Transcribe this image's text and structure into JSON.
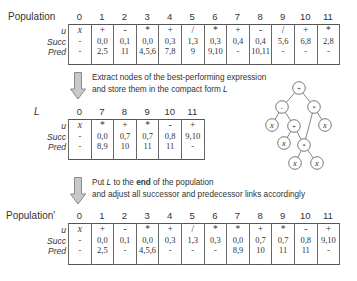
{
  "row_labels": [
    "u",
    "Succ",
    "Pred"
  ],
  "population": {
    "title": "Population",
    "columns": [
      {
        "idx": "0",
        "u": "x",
        "succ": "-",
        "pred": "-"
      },
      {
        "idx": "1",
        "u": "+",
        "succ": "0,0",
        "pred": "2,5"
      },
      {
        "idx": "2",
        "u": "-",
        "succ": "0,1",
        "pred": "11"
      },
      {
        "idx": "3",
        "u": "*",
        "succ": "0,0",
        "pred": "4,5,6"
      },
      {
        "idx": "4",
        "u": "+",
        "succ": "0,3",
        "pred": "7,8"
      },
      {
        "idx": "5",
        "u": "/",
        "succ": "1,3",
        "pred": "9"
      },
      {
        "idx": "6",
        "u": "*",
        "succ": "0,3",
        "pred": "9,10"
      },
      {
        "idx": "7",
        "u": "+",
        "succ": "0,4",
        "pred": "-"
      },
      {
        "idx": "8",
        "u": "-",
        "succ": "0,4",
        "pred": "10,11"
      },
      {
        "idx": "9",
        "u": "/",
        "succ": "5,6",
        "pred": "-"
      },
      {
        "idx": "10",
        "u": "+",
        "succ": "6,8",
        "pred": "-"
      },
      {
        "idx": "11",
        "u": "*",
        "succ": "2,8",
        "pred": "-"
      }
    ]
  },
  "step1": {
    "line1": "Extract nodes of the best-performing expression",
    "line2_prefix": "and store them in the compact form ",
    "line2_var": "L"
  },
  "compact": {
    "title": "L",
    "columns": [
      {
        "idx": "0",
        "u": "x",
        "succ": "-",
        "pred": "-"
      },
      {
        "idx": "7",
        "u": "*",
        "succ": "0,0",
        "pred": "8,9"
      },
      {
        "idx": "8",
        "u": "+",
        "succ": "0,7",
        "pred": "10"
      },
      {
        "idx": "9",
        "u": "*",
        "succ": "0,7",
        "pred": "11"
      },
      {
        "idx": "10",
        "u": "-",
        "succ": "0,8",
        "pred": "11"
      },
      {
        "idx": "11",
        "u": "+",
        "succ": "9,10",
        "pred": "-"
      }
    ]
  },
  "tree": {
    "nodes": [
      {
        "id": "n0",
        "label": "+",
        "x": 299,
        "y": 88
      },
      {
        "id": "n1",
        "label": "-",
        "x": 282,
        "y": 107
      },
      {
        "id": "n2",
        "label": "*",
        "x": 314,
        "y": 107
      },
      {
        "id": "n3",
        "label": "x",
        "x": 272,
        "y": 125
      },
      {
        "id": "n4",
        "label": "+",
        "x": 294,
        "y": 126
      },
      {
        "id": "n5",
        "label": "x",
        "x": 325,
        "y": 125
      },
      {
        "id": "n6",
        "label": "x",
        "x": 284,
        "y": 143
      },
      {
        "id": "n7",
        "label": "*",
        "x": 304,
        "y": 145
      },
      {
        "id": "n8",
        "label": "x",
        "x": 295,
        "y": 163
      },
      {
        "id": "n9",
        "label": "x",
        "x": 317,
        "y": 163
      }
    ],
    "edges": [
      [
        "n0",
        "n1"
      ],
      [
        "n0",
        "n2"
      ],
      [
        "n1",
        "n3"
      ],
      [
        "n1",
        "n4"
      ],
      [
        "n2",
        "n5"
      ],
      [
        "n2",
        "n7"
      ],
      [
        "n4",
        "n6"
      ],
      [
        "n4",
        "n7"
      ],
      [
        "n7",
        "n8"
      ],
      [
        "n7",
        "n9"
      ]
    ]
  },
  "step2": {
    "line1_prefix": "Put ",
    "line1_var": "L",
    "line1_mid": " to the ",
    "line1_bold": "end",
    "line1_suffix": " of the population",
    "line2": "and adjust all successor and predecessor links accordingly"
  },
  "population_prime": {
    "title": "Population'",
    "columns": [
      {
        "idx": "0",
        "u": "x",
        "succ": "-",
        "pred": "-"
      },
      {
        "idx": "1",
        "u": "+",
        "succ": "0,0",
        "pred": "2,5"
      },
      {
        "idx": "2",
        "u": "-",
        "succ": "0,1",
        "pred": "-"
      },
      {
        "idx": "3",
        "u": "*",
        "succ": "0,0",
        "pred": "4,5,6"
      },
      {
        "idx": "4",
        "u": "+",
        "succ": "0,3",
        "pred": "-"
      },
      {
        "idx": "5",
        "u": "/",
        "succ": "1,3",
        "pred": "-"
      },
      {
        "idx": "6",
        "u": "*",
        "succ": "0,3",
        "pred": "-"
      },
      {
        "idx": "7",
        "u": "*",
        "succ": "0,0",
        "pred": "8,9"
      },
      {
        "idx": "8",
        "u": "+",
        "succ": "0,7",
        "pred": "10"
      },
      {
        "idx": "9",
        "u": "*",
        "succ": "0,7",
        "pred": "11"
      },
      {
        "idx": "10",
        "u": "-",
        "succ": "0,8",
        "pred": "11"
      },
      {
        "idx": "11",
        "u": "+",
        "succ": "9,10",
        "pred": "-"
      }
    ]
  },
  "colors": {
    "arrow_fill": "#c8c8c8",
    "arrow_stroke": "#8a8a8a",
    "border": "#555555",
    "text": "#333333"
  }
}
